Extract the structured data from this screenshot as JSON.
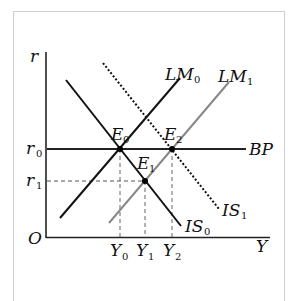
{
  "diagram": {
    "type": "IS-LM-BP model",
    "axes": {
      "x_label": "Y",
      "y_label": "r",
      "origin_label": "O"
    },
    "curves": [
      {
        "id": "IS0",
        "label": "IS",
        "sub": "0",
        "style": "solid",
        "color": "#111111"
      },
      {
        "id": "IS1",
        "label": "IS",
        "sub": "1",
        "style": "dotted",
        "color": "#111111"
      },
      {
        "id": "LM0",
        "label": "LM",
        "sub": "0",
        "style": "solid",
        "color": "#111111"
      },
      {
        "id": "LM1",
        "label": "LM",
        "sub": "1",
        "style": "solid",
        "color": "#888888"
      },
      {
        "id": "BP",
        "label": "BP",
        "sub": "",
        "style": "solid",
        "color": "#111111"
      }
    ],
    "points": [
      {
        "id": "E0",
        "label": "E",
        "sub": "0"
      },
      {
        "id": "E1",
        "label": "E",
        "sub": "1"
      },
      {
        "id": "E2",
        "label": "E",
        "sub": "2"
      }
    ],
    "y_ticks": [
      {
        "label": "r",
        "sub": "0"
      },
      {
        "label": "r",
        "sub": "1"
      }
    ],
    "x_ticks": [
      {
        "label": "Y",
        "sub": "0"
      },
      {
        "label": "Y",
        "sub": "1"
      },
      {
        "label": "Y",
        "sub": "2"
      }
    ]
  }
}
